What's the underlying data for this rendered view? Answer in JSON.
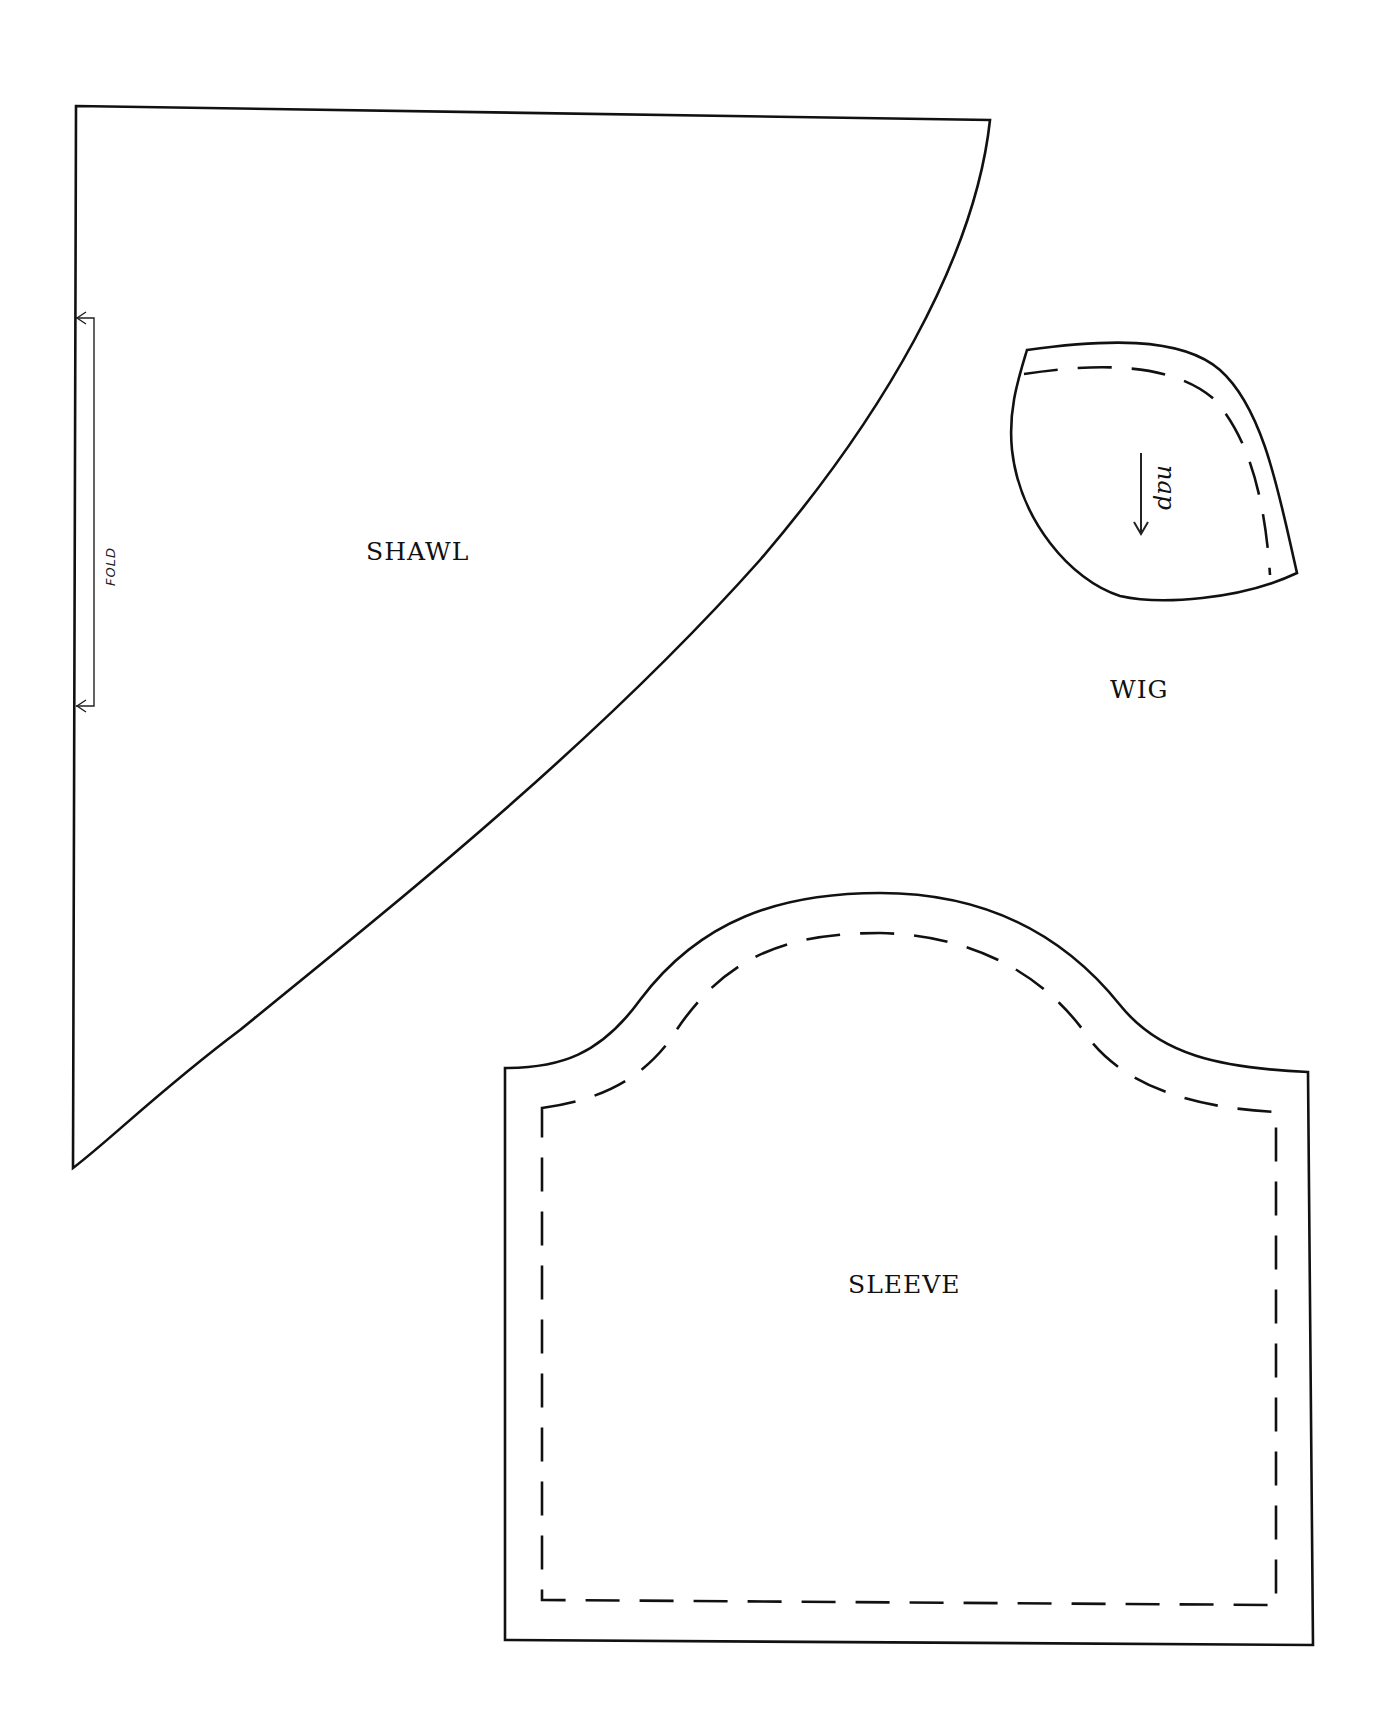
{
  "page": {
    "background": "#ffffff",
    "line_color": "#111111"
  },
  "pieces": {
    "shawl": {
      "label": "SHAWL",
      "fold_marker": {
        "label": "FOLD",
        "icon": "fold-bracket-arrows"
      }
    },
    "wig": {
      "label": "WIG",
      "grain_marker": {
        "label": "nap",
        "icon": "arrow-down"
      }
    },
    "sleeve": {
      "label": "SLEEVE"
    }
  },
  "legend": {
    "solid_line": "cutting line",
    "dashed_line": "seam line"
  }
}
